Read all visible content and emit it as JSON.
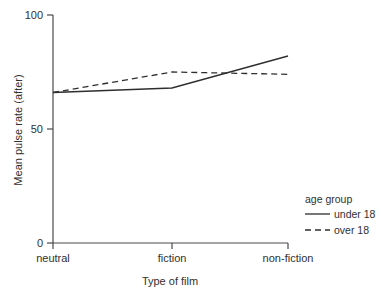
{
  "chart_data": {
    "type": "line",
    "title": "",
    "xlabel": "Type of film",
    "ylabel": "Mean pulse rate (after)",
    "categories": [
      "neutral",
      "fiction",
      "non-fiction"
    ],
    "ylim": [
      0,
      100
    ],
    "yticks": [
      0,
      50,
      100
    ],
    "ytick_labels": [
      "0",
      "50",
      "100"
    ],
    "grid": false,
    "legend_position": "right-bottom",
    "legend_title": "age group",
    "series": [
      {
        "name": "under 18",
        "style": "solid",
        "color": "#2e2e2e",
        "values": [
          66,
          68,
          82
        ]
      },
      {
        "name": "over 18",
        "style": "dashed",
        "color": "#2e2e2e",
        "values": [
          66,
          75,
          74
        ]
      }
    ]
  },
  "axis": {
    "y_label": "Mean pulse rate (after)",
    "x_label": "Type of film",
    "y_tick_top": "100",
    "y_tick_mid": "50",
    "y_tick_bottom": "0",
    "x_cat_1": "neutral",
    "x_cat_2": "fiction",
    "x_cat_3": "non-fiction"
  },
  "legend": {
    "title": "age group",
    "entry_1": "under 18",
    "entry_2": "over 18"
  }
}
